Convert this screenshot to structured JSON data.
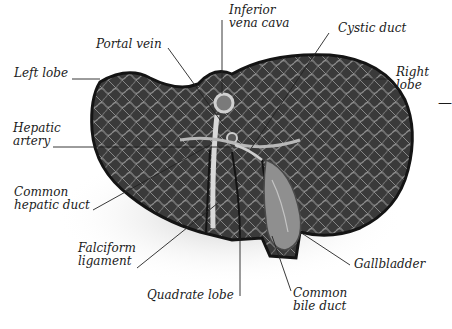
{
  "diagram": {
    "labels": {
      "inferior_vena_cava": [
        "Inferior",
        "vena cava"
      ],
      "portal_vein": "Portal vein",
      "cystic_duct": "Cystic duct",
      "left_lobe": "Left lobe",
      "right_lobe": [
        "Right",
        "lobe"
      ],
      "hepatic_artery": [
        "Hepatic",
        "artery"
      ],
      "common_hepatic_duct": [
        "Common",
        "hepatic duct"
      ],
      "falciform_ligament": [
        "Falciform",
        "ligament"
      ],
      "gallbladder": "Gallbladder",
      "quadrate_lobe": "Quadrate lobe",
      "common_bile_duct": [
        "Common",
        "bile duct"
      ],
      "cut_off_right_edge": [
        "—",
        ""
      ]
    },
    "colors": {
      "liver_dark": "#2e2e2e",
      "liver_mid": "#5a5a5a",
      "vessel_light": "#bdbdbd",
      "gallbladder": "#8a8a8a",
      "leader_line": "#222222",
      "background": "#ffffff"
    }
  }
}
